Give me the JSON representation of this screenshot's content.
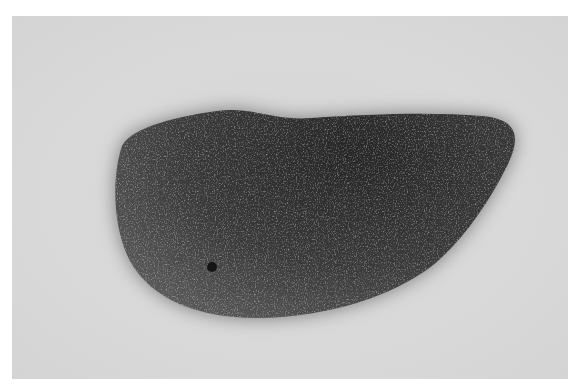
{
  "image": {
    "description": "Grayscale photograph of a dark fibrous, hair-like mass (resembling a hairball or felted wool clump) resting on a plain light gray background",
    "subject": "fibrous mass",
    "colors": {
      "border": "#ffffff",
      "background": "#d8d8d8",
      "subject_dark": "#2a2a2a",
      "subject_mid": "#6a6a6a",
      "fiber_highlight": "#b8b8b8"
    }
  }
}
